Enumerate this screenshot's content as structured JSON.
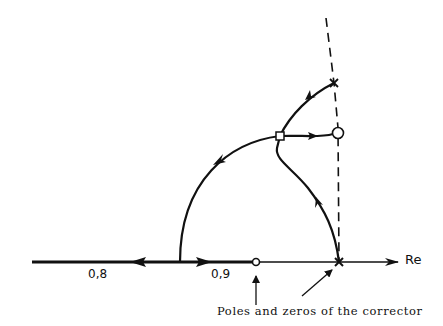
{
  "diagram": {
    "type": "root-locus",
    "axis_label": "Re",
    "gain_labels": [
      {
        "text": "0,8"
      },
      {
        "text": "0,9"
      }
    ],
    "caption": "Poles and zeros of the corrector",
    "elements": {
      "poles": [
        "cross-on-real-axis",
        "cross-upper"
      ],
      "zeros": [
        "circle-on-real-axis",
        "circle-on-dashed-line"
      ],
      "marker": "square-breakpoint"
    },
    "colors": {
      "stroke": "#111111",
      "background": "#ffffff"
    }
  }
}
